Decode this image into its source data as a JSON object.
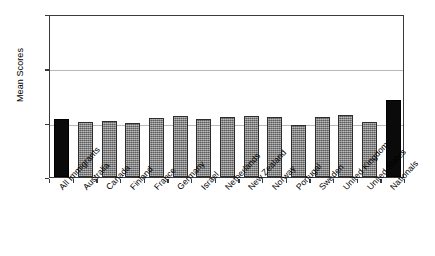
{
  "chart_data": {
    "type": "bar",
    "title": "",
    "xlabel": "",
    "ylabel": "Mean Scores",
    "ylim": [
      1.0,
      2.5
    ],
    "yticks": [
      "1.0",
      "1.5",
      "2.0",
      "2.5"
    ],
    "ytick_values": [
      1.0,
      1.5,
      2.0,
      2.5
    ],
    "grid": "horizontal gridlines at 1.5 and 2.0",
    "legend": "none",
    "categories": [
      "All Immigrants",
      "Australia",
      "Canada",
      "Finland",
      "France",
      "Germany",
      "Israel",
      "Netherlands",
      "New Zealand",
      "Norway",
      "Portugal",
      "Sweden",
      "United Kingdom",
      "United States",
      "Nationals"
    ],
    "values": [
      1.53,
      1.51,
      1.52,
      1.5,
      1.54,
      1.56,
      1.53,
      1.55,
      1.56,
      1.55,
      1.48,
      1.55,
      1.57,
      1.51,
      1.71
    ],
    "bar_colors": [
      "#0a0a0a",
      "#7c7c7c",
      "#7c7c7c",
      "#7c7c7c",
      "#7c7c7c",
      "#7c7c7c",
      "#7c7c7c",
      "#7c7c7c",
      "#7c7c7c",
      "#7c7c7c",
      "#7c7c7c",
      "#7c7c7c",
      "#7c7c7c",
      "#7c7c7c",
      "#0a0a0a"
    ]
  },
  "colors": {
    "axis": "#3a3a3a",
    "grid": "#b8b8b8",
    "bar_grey": "#7c7c7c",
    "bar_black": "#0a0a0a",
    "background": "#ffffff"
  }
}
